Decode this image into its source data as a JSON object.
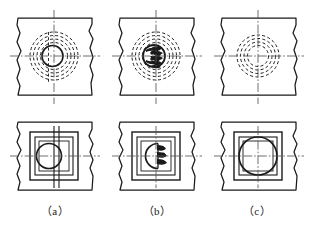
{
  "figure": {
    "kind": "engineering-drawing",
    "background": "#ffffff",
    "ink_color": "#1a1a1a",
    "panel_count": 6,
    "rows": [
      "top-view",
      "front-view"
    ],
    "columns": [
      "a",
      "b",
      "c"
    ]
  },
  "captions": {
    "a": "（a）",
    "b": "（b）",
    "c": "（c）"
  },
  "panels": [
    {
      "id": "a-top",
      "column": "a",
      "row": "top-view",
      "description": "Square plate with wavy break edges; solid circle hole with four concentric dashed hidden circles; vertical and horizontal centre lines crossing at the hole centre",
      "solid_circles": 1,
      "dashed_circles": 4,
      "centre_lines": [
        "vertical",
        "horizontal"
      ]
    },
    {
      "id": "b-top",
      "column": "b",
      "row": "top-view",
      "description": "Square plate with wavy break edges; solid circle hole with dense hatched/serrated inner detail and concentric dashed hidden circles; vertical and horizontal centre lines",
      "solid_circles": 1,
      "dashed_circles": 4,
      "centre_lines": [
        "vertical",
        "horizontal"
      ],
      "has_hatching": true
    },
    {
      "id": "c-top",
      "column": "c",
      "row": "top-view",
      "description": "Square plate with wavy break edges; hole shown only as four concentric dashed hidden circles, no solid circle; vertical and horizontal centre lines",
      "solid_circles": 0,
      "dashed_circles": 4,
      "centre_lines": [
        "vertical",
        "horizontal"
      ]
    },
    {
      "id": "a-front",
      "column": "a",
      "row": "front-view",
      "description": "Rectangular plate with wavy break edges; nested rectangles, inner circle and a pair of vertical hidden lines through the circle; horizontal centre line",
      "rectangles": 3,
      "circles": 1,
      "centre_lines": [
        "horizontal",
        "vertical"
      ]
    },
    {
      "id": "b-front",
      "column": "b",
      "row": "front-view",
      "description": "Rectangular plate with wavy break edges; nested rectangles, circle with hatched/serrated detail on its right side; horizontal centre line",
      "rectangles": 3,
      "circles": 1,
      "centre_lines": [
        "horizontal",
        "vertical"
      ],
      "has_hatching": true
    },
    {
      "id": "c-front",
      "column": "c",
      "row": "front-view",
      "description": "Rectangular plate with wavy break edges; nested rectangles and a large plain circle; horizontal and vertical centre lines",
      "rectangles": 3,
      "circles": 1,
      "centre_lines": [
        "horizontal",
        "vertical"
      ]
    }
  ],
  "style": {
    "solid_stroke": "#1a1a1a",
    "dashed_stroke": "#1a1a1a",
    "centre_line_stroke": "#555555",
    "dash_pattern": "3 2.4",
    "centre_dash_pattern": "7 2 1.5 2"
  }
}
